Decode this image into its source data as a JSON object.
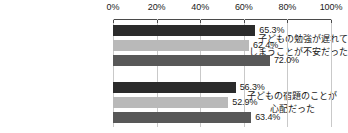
{
  "chart_data": {
    "type": "bar",
    "orientation": "horizontal",
    "title": "",
    "subtitle": "",
    "xlabel": "",
    "ylabel": "",
    "xlim": [
      0,
      100
    ],
    "xticks": [
      0,
      20,
      40,
      60,
      80,
      100
    ],
    "xtick_labels": [
      "0%",
      "20%",
      "40%",
      "60%",
      "80%",
      "100%"
    ],
    "grid": true,
    "grid_axis": "x",
    "legend": false,
    "legend_position": "none",
    "categories": [
      "子どもの勉強が遅れてしまうことが不安だった",
      "子どもの宿題のことが心配だった"
    ],
    "category_lines": [
      [
        "子どもの勉強が遅れて",
        "しまうことが不安だった"
      ],
      [
        "子どもの宿題のことが",
        "心配だった"
      ]
    ],
    "series": [
      {
        "name": "series-1",
        "color": "#2b2b2b",
        "values": [
          65.3,
          56.3
        ]
      },
      {
        "name": "series-2",
        "color": "#b9b9b9",
        "values": [
          62.4,
          52.9
        ]
      },
      {
        "name": "series-3",
        "color": "#585858",
        "values": [
          72.0,
          63.4
        ]
      }
    ],
    "value_labels": [
      [
        "65.3%",
        "62.4%",
        "72.0%"
      ],
      [
        "56.3%",
        "52.9%",
        "63.4%"
      ]
    ],
    "colors": {
      "series_1": "#2b2b2b",
      "series_2": "#b9b9b9",
      "series_3": "#585858",
      "axis": "#4a4a4a",
      "gridline": "#c9c9c9",
      "text": "#1a1a1a",
      "background": "#ffffff"
    }
  },
  "axis": {
    "ticks": [
      {
        "label": "0%",
        "value": 0
      },
      {
        "label": "20%",
        "value": 20
      },
      {
        "label": "40%",
        "value": 40
      },
      {
        "label": "60%",
        "value": 60
      },
      {
        "label": "80%",
        "value": 80
      },
      {
        "label": "100%",
        "value": 100
      }
    ]
  },
  "groups": [
    {
      "label_lines": [
        "子どもの勉強が遅れて",
        "しまうことが不安だった"
      ],
      "bars": [
        {
          "value": 65.3,
          "label": "65.3%",
          "color": "#2b2b2b"
        },
        {
          "value": 62.4,
          "label": "62.4%",
          "color": "#b9b9b9"
        },
        {
          "value": 72.0,
          "label": "72.0%",
          "color": "#585858"
        }
      ]
    },
    {
      "label_lines": [
        "子どもの宿題のことが",
        "心配だった"
      ],
      "bars": [
        {
          "value": 56.3,
          "label": "56.3%",
          "color": "#2b2b2b"
        },
        {
          "value": 52.9,
          "label": "52.9%",
          "color": "#b9b9b9"
        },
        {
          "value": 63.4,
          "label": "63.4%",
          "color": "#585858"
        }
      ]
    }
  ]
}
